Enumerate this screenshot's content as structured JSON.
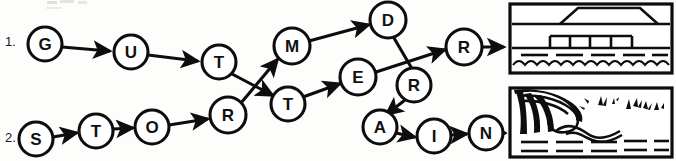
{
  "page": {
    "width": 676,
    "height": 161,
    "background_color": "#fdfdfc",
    "ink_color": "#0d0d0d"
  },
  "rows": [
    {
      "label": "1.",
      "name": "row-number-1"
    },
    {
      "label": "2.",
      "name": "row-number-2"
    }
  ],
  "nodes": [
    {
      "id": "n-g",
      "label": "G",
      "cx": 45,
      "cy": 44,
      "r": 17
    },
    {
      "id": "n-u",
      "label": "U",
      "cx": 131,
      "cy": 52,
      "r": 17
    },
    {
      "id": "n-t1",
      "label": "T",
      "cx": 219,
      "cy": 62,
      "r": 17
    },
    {
      "id": "n-m",
      "label": "M",
      "cx": 292,
      "cy": 46,
      "r": 18
    },
    {
      "id": "n-d",
      "label": "D",
      "cx": 388,
      "cy": 20,
      "r": 18
    },
    {
      "id": "n-rf",
      "label": "R",
      "cx": 464,
      "cy": 47,
      "r": 18
    },
    {
      "id": "n-e",
      "label": "E",
      "cx": 358,
      "cy": 77,
      "r": 18
    },
    {
      "id": "n-r2",
      "label": "R",
      "cx": 414,
      "cy": 85,
      "r": 17
    },
    {
      "id": "n-s",
      "label": "S",
      "cx": 36,
      "cy": 139,
      "r": 17
    },
    {
      "id": "n-t2",
      "label": "T",
      "cx": 96,
      "cy": 131,
      "r": 17
    },
    {
      "id": "n-o",
      "label": "O",
      "cx": 152,
      "cy": 127,
      "r": 17
    },
    {
      "id": "n-r1",
      "label": "R",
      "cx": 228,
      "cy": 115,
      "r": 18
    },
    {
      "id": "n-t3",
      "label": "T",
      "cx": 288,
      "cy": 104,
      "r": 17
    },
    {
      "id": "n-a",
      "label": "A",
      "cx": 380,
      "cy": 127,
      "r": 17
    },
    {
      "id": "n-i",
      "label": "I",
      "cx": 434,
      "cy": 136,
      "r": 17
    },
    {
      "id": "n-n",
      "label": "N",
      "cx": 486,
      "cy": 133,
      "r": 17
    }
  ],
  "edges": [
    {
      "name": "edge-g-to-u",
      "from": "G",
      "to": "U"
    },
    {
      "name": "edge-u-to-t1",
      "from": "U",
      "to": "T"
    },
    {
      "name": "edge-t1-to-t3",
      "from": "T",
      "to": "T"
    },
    {
      "name": "edge-r1-to-m",
      "from": "R",
      "to": "M"
    },
    {
      "name": "edge-m-to-d",
      "from": "M",
      "to": "D"
    },
    {
      "name": "edge-d-to-r2",
      "from": "D",
      "to": "R"
    },
    {
      "name": "edge-e-to-rf",
      "from": "E",
      "to": "R"
    },
    {
      "name": "edge-s-to-t2",
      "from": "S",
      "to": "T"
    },
    {
      "name": "edge-t2-to-o",
      "from": "T",
      "to": "O"
    },
    {
      "name": "edge-o-to-r1",
      "from": "O",
      "to": "R"
    },
    {
      "name": "edge-t3-to-e",
      "from": "T",
      "to": "E"
    },
    {
      "name": "edge-r2-to-a",
      "from": "R",
      "to": "A"
    },
    {
      "name": "edge-a-to-i",
      "from": "A",
      "to": "I"
    },
    {
      "name": "edge-i-to-n",
      "from": "I",
      "to": "N"
    },
    {
      "name": "edge-rf-to-picture-1",
      "from": "R",
      "to": "picture-1"
    },
    {
      "name": "edge-n-to-picture-2",
      "from": "N",
      "to": "picture-2"
    }
  ],
  "pictures": [
    {
      "name": "picture-bridge-over-water",
      "description": "bridge over water",
      "x": 510,
      "y": 4,
      "width": 162,
      "height": 69
    },
    {
      "name": "picture-breaking-wave",
      "description": "breaking wave on shore",
      "x": 510,
      "y": 88,
      "width": 162,
      "height": 69
    }
  ]
}
